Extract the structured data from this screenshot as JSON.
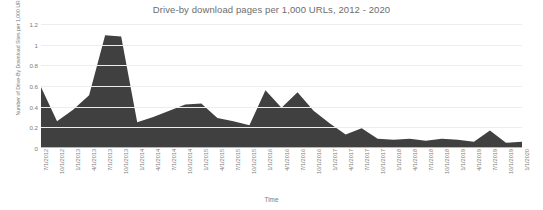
{
  "chart_data": {
    "type": "area",
    "title": "Drive-by download pages per 1,000 URLs, 2012 - 2020",
    "xlabel": "Time",
    "ylabel": "Number of Drive-By Download Sites per 1,000 URLs",
    "ylim": [
      0,
      1.2
    ],
    "ytick_labels": [
      "1.2",
      "1",
      "0.8",
      "0.6",
      "0.4",
      "0.2",
      "0"
    ],
    "ytick_values": [
      1.2,
      1.0,
      0.8,
      0.6,
      0.4,
      0.2,
      0
    ],
    "grid": true,
    "legend": "none",
    "series_color": "#404040",
    "categories": [
      "7/1/2012",
      "10/1/2012",
      "1/1/2013",
      "4/1/2013",
      "7/1/2013",
      "10/1/2013",
      "1/1/2014",
      "4/1/2014",
      "7/1/2014",
      "10/1/2014",
      "1/1/2015",
      "4/1/2015",
      "7/1/2015",
      "10/1/2015",
      "1/1/2016",
      "4/1/2016",
      "7/1/2016",
      "10/1/2016",
      "1/1/2017",
      "4/1/2017",
      "7/1/2017",
      "10/1/2017",
      "1/1/2018",
      "4/1/2018",
      "7/1/2018",
      "10/1/2018",
      "1/1/2019",
      "4/1/2019",
      "7/1/2019",
      "10/1/2019",
      "1/1/2020"
    ],
    "values": [
      0.59,
      0.26,
      0.37,
      0.51,
      1.09,
      1.08,
      0.25,
      0.3,
      0.36,
      0.42,
      0.43,
      0.29,
      0.26,
      0.22,
      0.56,
      0.39,
      0.54,
      0.36,
      0.24,
      0.13,
      0.19,
      0.09,
      0.08,
      0.09,
      0.07,
      0.09,
      0.08,
      0.06,
      0.17,
      0.05,
      0.06
    ]
  }
}
